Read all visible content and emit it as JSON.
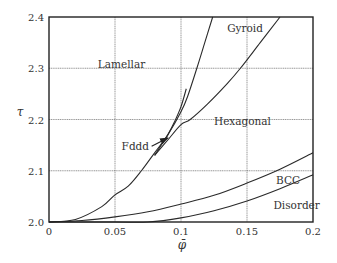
{
  "chart_data": {
    "type": "line",
    "title": "",
    "xlabel": "φ̄",
    "ylabel": "τ",
    "xlim": [
      0,
      0.2
    ],
    "ylim": [
      2.0,
      2.4
    ],
    "grid": true,
    "legend": "none (regions labeled in-plot)",
    "x_ticks": [
      0,
      0.05,
      0.1,
      0.15,
      0.2
    ],
    "x_tick_labels": [
      "0",
      "0.05",
      "0.1",
      "0.15",
      "0.2"
    ],
    "y_ticks": [
      2.0,
      2.1,
      2.2,
      2.3,
      2.4
    ],
    "y_tick_labels": [
      "2.0",
      "2.1",
      "2.2",
      "2.3",
      "2.4"
    ],
    "series": [
      {
        "name": "Lamellar–Hexagonal / Lamellar–Gyroid boundary",
        "x": [
          0,
          0.02,
          0.04,
          0.05,
          0.06,
          0.07,
          0.08,
          0.09,
          0.1,
          0.105,
          0.112,
          0.118,
          0.124
        ],
        "y": [
          2.0,
          2.005,
          2.03,
          2.053,
          2.07,
          2.1,
          2.135,
          2.17,
          2.215,
          2.245,
          2.3,
          2.35,
          2.4
        ]
      },
      {
        "name": "Gyroid–Hexagonal boundary",
        "x": [
          0.08,
          0.09,
          0.1,
          0.107,
          0.12,
          0.135,
          0.145,
          0.16,
          0.175
        ],
        "y": [
          2.13,
          2.16,
          2.19,
          2.2,
          2.23,
          2.27,
          2.3,
          2.35,
          2.4
        ]
      },
      {
        "name": "Fddd window (upper edge)",
        "x": [
          0.08,
          0.085,
          0.09,
          0.095,
          0.1,
          0.104
        ],
        "y": [
          2.13,
          2.15,
          2.17,
          2.195,
          2.225,
          2.26
        ]
      },
      {
        "name": "Hexagonal–BCC boundary",
        "x": [
          0,
          0.025,
          0.05,
          0.075,
          0.1,
          0.125,
          0.15,
          0.175,
          0.2
        ],
        "y": [
          2.0,
          2.003,
          2.01,
          2.02,
          2.035,
          2.052,
          2.076,
          2.103,
          2.135
        ]
      },
      {
        "name": "BCC–Disorder boundary",
        "x": [
          0.0,
          0.05,
          0.075,
          0.1,
          0.125,
          0.15,
          0.175,
          0.2
        ],
        "y": [
          2.0,
          2.0,
          2.0,
          2.008,
          2.022,
          2.041,
          2.065,
          2.092
        ]
      }
    ],
    "annotations": [
      {
        "text": "Lamellar",
        "x": 0.037,
        "y": 2.3
      },
      {
        "text": "Gyroid",
        "x": 0.135,
        "y": 2.37
      },
      {
        "text": "Hexagonal",
        "x": 0.125,
        "y": 2.19
      },
      {
        "text": "Fddd",
        "x": 0.055,
        "y": 2.14,
        "arrow_to": {
          "x": 0.09,
          "y": 2.164
        }
      },
      {
        "text": "BCC",
        "x": 0.172,
        "y": 2.075
      },
      {
        "text": "Disorder",
        "x": 0.17,
        "y": 2.025
      }
    ]
  },
  "layout": {
    "plot": {
      "left": 49,
      "right": 313,
      "top": 17,
      "bottom": 222
    }
  }
}
